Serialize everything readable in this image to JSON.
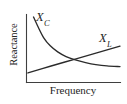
{
  "figure": {
    "background_color": "#ffffff",
    "line_color": "#2b2b2b",
    "axis_color": "#3f3f3f"
  },
  "chart_data": {
    "type": "line",
    "title": "",
    "xlabel": "Frequency",
    "ylabel": "Reactance",
    "grid": false,
    "legend": "inline-labels",
    "axes": {
      "x_axis_visible": true,
      "y_axis_visible": true,
      "x_ticks": [],
      "y_ticks": [],
      "xlim": [
        0,
        1
      ],
      "ylim": [
        0,
        1
      ]
    },
    "annotations": [
      {
        "text": "X_C",
        "symbol": "X",
        "subscript": "C",
        "x": 0.11,
        "y": 0.93
      },
      {
        "text": "X_L",
        "symbol": "X",
        "subscript": "L",
        "x": 0.79,
        "y": 0.72
      }
    ],
    "series": [
      {
        "name": "X_C",
        "label_symbol": "X",
        "label_subscript": "C",
        "shape": "inverse-decay",
        "x": [
          0.07,
          0.12,
          0.18,
          0.25,
          0.33,
          0.42,
          0.52,
          0.63,
          0.74,
          0.86,
          1.0
        ],
        "values": [
          0.97,
          0.82,
          0.66,
          0.54,
          0.45,
          0.38,
          0.33,
          0.29,
          0.26,
          0.24,
          0.23
        ]
      },
      {
        "name": "X_L",
        "label_symbol": "X",
        "label_subscript": "L",
        "shape": "linear-rise",
        "x": [
          0.01,
          0.25,
          0.5,
          0.75,
          1.0
        ],
        "values": [
          0.135,
          0.235,
          0.335,
          0.435,
          0.535
        ]
      }
    ],
    "crossing_point": {
      "x": 0.47,
      "y": 0.37
    }
  },
  "labels": {
    "xc": "X",
    "xc_sub": "C",
    "xl": "X",
    "xl_sub": "L",
    "x_axis": "Frequency",
    "y_axis": "Reactance"
  }
}
